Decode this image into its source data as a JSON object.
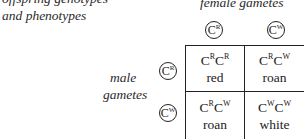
{
  "title_lines": [
    "offspring genotypes",
    "and phenotypes"
  ],
  "female_label": "female gametes",
  "male_label_lines": [
    "male",
    "gametes"
  ],
  "female_gametes": [
    {
      "base": "C",
      "allele": "R"
    },
    {
      "base": "C",
      "allele": "W"
    }
  ],
  "male_gametes": [
    {
      "base": "C",
      "allele": "R"
    },
    {
      "base": "C",
      "allele": "W"
    }
  ],
  "cells": [
    {
      "a1": "R",
      "a2": "R",
      "phenotype": "red"
    },
    {
      "a1": "R",
      "a2": "W",
      "phenotype": "roan"
    },
    {
      "a1": "R",
      "a2": "W",
      "phenotype": "roan"
    },
    {
      "a1": "W",
      "a2": "W",
      "phenotype": "white"
    }
  ],
  "base_letter": "C"
}
